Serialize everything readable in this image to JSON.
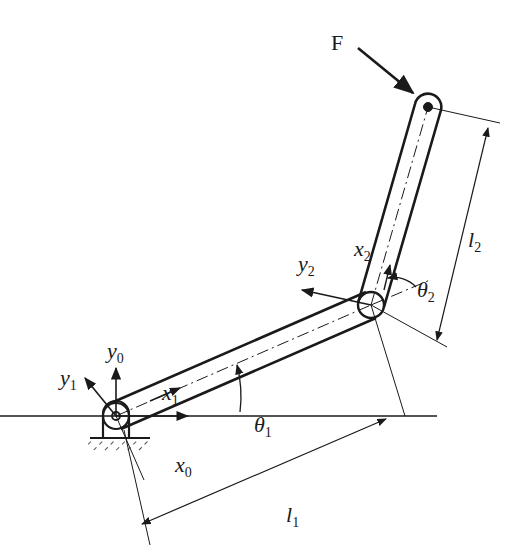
{
  "diagram": {
    "type": "two-link planar manipulator",
    "colors": {
      "ink": "#1a1a1a",
      "background": "#ffffff"
    },
    "labels": {
      "force": "F",
      "x0": "x",
      "x0_sub": "0",
      "y0": "y",
      "y0_sub": "0",
      "x1": "x",
      "x1_sub": "1",
      "y1": "y",
      "y1_sub": "1",
      "x2": "x",
      "x2_sub": "2",
      "y2": "y",
      "y2_sub": "2",
      "theta1": "θ",
      "theta1_sub": "1",
      "theta2": "θ",
      "theta2_sub": "2",
      "l1": "l",
      "l1_sub": "1",
      "l2": "l",
      "l2_sub": "2"
    },
    "joints": [
      {
        "name": "base-joint",
        "x": 116,
        "y": 416
      },
      {
        "name": "elbow-joint",
        "x": 371,
        "y": 305
      },
      {
        "name": "end-effector",
        "x": 428,
        "y": 107
      }
    ]
  }
}
